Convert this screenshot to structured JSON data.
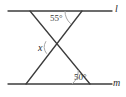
{
  "figure": {
    "background_color": "#ffffff",
    "stroke_color": "#3c3c3c",
    "arc_color": "#9a9a9a",
    "labels": {
      "angle_top": "55°",
      "angle_bottom": "50°",
      "unknown_angle": "x",
      "line_top": "l",
      "line_bottom": "m"
    },
    "geometry": {
      "line_l": {
        "x1": 8,
        "y1": 11,
        "x2": 112,
        "y2": 11
      },
      "line_m": {
        "x1": 8,
        "y1": 84,
        "x2": 112,
        "y2": 84
      },
      "transversal_1": {
        "x1": 30,
        "y1": 11,
        "x2": 90,
        "y2": 84
      },
      "transversal_2": {
        "x1": 82,
        "y1": 11,
        "x2": 26,
        "y2": 84
      },
      "intersection": {
        "x": 55,
        "y": 47
      }
    },
    "arcs": {
      "top_arc": {
        "cx": 82,
        "cy": 11,
        "r": 17
      },
      "bottom_arc": {
        "cx": 90,
        "cy": 84,
        "r": 18
      },
      "x_arc": {
        "cx": 55,
        "cy": 47,
        "r": 11
      }
    }
  }
}
